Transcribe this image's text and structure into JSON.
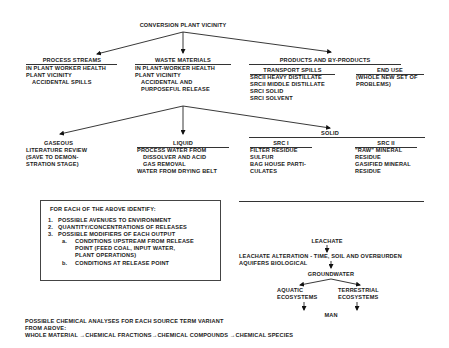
{
  "root": {
    "label": "CONVERSION PLANT VICINITY"
  },
  "process_streams": {
    "title": "PROCESS STREAMS",
    "items": [
      "IN PLANT WORKER HEALTH",
      "PLANT VICINITY",
      "ACCIDENTAL SPILLS"
    ]
  },
  "waste_materials": {
    "title": "WASTE MATERIALS",
    "items": [
      "IN PLANT-WORKER HEALTH",
      "PLANT VICINITY",
      "ACCIDENTAL AND",
      "PURPOSEFUL RELEASE"
    ]
  },
  "products": {
    "title": "PRODUCTS AND BY-PRODUCTS",
    "transport_spills": {
      "title": "TRANSPORT SPILLS",
      "items": [
        "SRCII HEAVY DISTILLATE",
        "SRCII MIDDLE DISTILLATE",
        "SRCI SOLID",
        "SRCI SOLVENT"
      ]
    },
    "end_use": {
      "title": "END USE",
      "items": [
        "(WHOLE NEW SET OF",
        "PROBLEMS)"
      ]
    }
  },
  "gaseous": {
    "title": "GASEOUS",
    "items": [
      "LITERATURE REVIEW",
      "(SAVE TO DEMON-",
      "STRATION STAGE)"
    ]
  },
  "liquid": {
    "title": "LIQUID",
    "items": [
      "PROCESS WATER FROM",
      "DISSOLVER AND ACID",
      "GAS REMOVAL",
      "WATER FROM DRYING BELT"
    ]
  },
  "solid": {
    "title": "SOLID",
    "src1": {
      "title": "SRC I",
      "items": [
        "FILTER RESIDUE",
        "SULFUR",
        "BAG HOUSE PARTI-",
        "CULATES"
      ]
    },
    "src2": {
      "title": "SRC II",
      "items": [
        "\"RAW\" MINERAL",
        "RESIDUE",
        "GASIFIED  MINERAL",
        "RESIDUE"
      ]
    }
  },
  "identify_box": {
    "heading": "FOR EACH OF THE ABOVE IDENTIFY:",
    "items": [
      {
        "num": "1.",
        "text": "POSSIBLE AVENUES TO ENVIRONMENT"
      },
      {
        "num": "2.",
        "text": "QUANTITY/CONCENTRATIONS OF RELEASES"
      },
      {
        "num": "3.",
        "text": "POSSIBLE MODIFIERS OF EACH OUTPUT"
      }
    ],
    "subitems": [
      {
        "num": "a.",
        "lines": [
          "CONDITIONS UPSTREAM FROM RELEASE",
          "POINT (FEED COAL, INPUT WATER,",
          "PLANT OPERATIONS)"
        ]
      },
      {
        "num": "b.",
        "lines": [
          "CONDITIONS AT RELEASE POINT"
        ]
      }
    ]
  },
  "leachate": {
    "title": "LEACHATE",
    "alteration_lines": [
      "LEACHATE ALTERATION - TIME, SOIL AND OVERBURDEN",
      "AQUIFERS  BIOLOGICAL"
    ],
    "groundwater": "GROUNDWATER",
    "aquatic": [
      "AQUATIC",
      "ECOSYSTEMS"
    ],
    "terrestrial": [
      "TERRESTRIAL",
      "ECOSYSTEMS"
    ],
    "man": "MAN"
  },
  "footer": {
    "lines": [
      "POSSIBLE CHEMICAL ANALYSES FOR EACH SOURCE TERM VARIANT",
      "FROM ABOVE:"
    ],
    "chain": [
      "WHOLE MATERIAL",
      "CHEMICAL FRACTIONS",
      "CHEMICAL COMPOUNDS",
      "CHEMICAL SPECIES"
    ],
    "arrow": "→"
  }
}
